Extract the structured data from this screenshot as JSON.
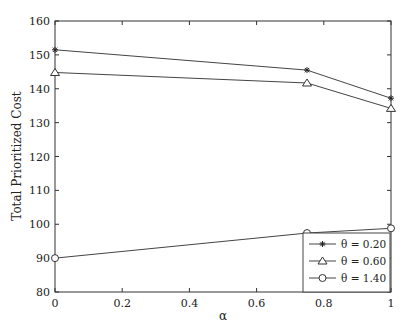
{
  "chart_data": {
    "type": "line",
    "title": "",
    "xlabel": "α",
    "ylabel": "Total Prioritized Cost",
    "xlim": [
      0,
      1
    ],
    "ylim": [
      80,
      160
    ],
    "xticks": [
      "0",
      "0.2",
      "0.4",
      "0.6",
      "0.8",
      "1"
    ],
    "yticks": [
      "80",
      "90",
      "100",
      "110",
      "120",
      "130",
      "140",
      "150",
      "160"
    ],
    "grid": false,
    "legend_position": "lower right",
    "x": [
      0,
      0.75,
      1
    ],
    "series": [
      {
        "name": "θ = 0.20",
        "marker": "star",
        "values": [
          151.5,
          145.5,
          137.2
        ]
      },
      {
        "name": "θ = 0.60",
        "marker": "triangle",
        "values": [
          144.8,
          141.7,
          134.2
        ]
      },
      {
        "name": "θ = 1.40",
        "marker": "circle",
        "values": [
          90.0,
          97.4,
          98.8
        ]
      }
    ]
  }
}
